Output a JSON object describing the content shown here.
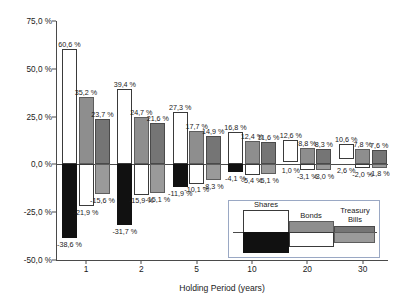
{
  "chart_data": {
    "type": "bar",
    "title": "",
    "xlabel": "Holding Period (years)",
    "ylabel": "Compound Annual Returns",
    "categories": [
      "1",
      "2",
      "5",
      "10",
      "20",
      "30"
    ],
    "ylim": [
      -50.0,
      75.0
    ],
    "yticks": [
      "75,0 %",
      "50,0 %",
      "25,0 %",
      "0,0 %",
      "-25,0 %",
      "-50,0 %"
    ],
    "ytick_values": [
      75.0,
      50.0,
      25.0,
      0.0,
      -25.0,
      -50.0
    ],
    "grid": false,
    "legend_position": "inside-bottom-right",
    "series": [
      {
        "name": "Shares",
        "max_values": [
          60.6,
          39.4,
          27.3,
          16.8,
          12.6,
          10.6
        ],
        "min_values": [
          -38.6,
          -31.7,
          -11.9,
          -4.1,
          1.0,
          2.6
        ],
        "max_labels": [
          "60,6 %",
          "39,4 %",
          "27,3 %",
          "16,8 %",
          "12,6 %",
          "10,6 %"
        ],
        "min_labels": [
          "-38,6 %",
          "-31,7 %",
          "-11,9 %",
          "-4,1 %",
          "1,0 %",
          "2,6 %"
        ]
      },
      {
        "name": "Bonds",
        "max_values": [
          35.2,
          24.7,
          17.7,
          12.4,
          8.8,
          7.8
        ],
        "min_values": [
          -21.9,
          -15.9,
          -10.1,
          -5.4,
          -3.1,
          -2.0
        ],
        "max_labels": [
          "35,2 %",
          "24,7 %",
          "17,7 %",
          "12,4 %",
          "8,8 %",
          "7,8 %"
        ],
        "min_labels": [
          "-21,9 %",
          "-15,9 %",
          "-10,1 %",
          "-5,4 %",
          "-3,1 %",
          "-2,0 %"
        ]
      },
      {
        "name": "Treasury Bills",
        "max_values": [
          23.7,
          21.6,
          14.9,
          11.6,
          8.3,
          7.6
        ],
        "min_values": [
          -15.6,
          -15.1,
          -8.3,
          -5.1,
          -3.0,
          -1.8
        ],
        "max_labels": [
          "23,7 %",
          "21,6 %",
          "14,9 %",
          "11,6 %",
          "8,3 %",
          "7,6 %"
        ],
        "min_labels": [
          "-15,6 %",
          "-15,1 %",
          "-8,3 %",
          "-5,1 %",
          "-3,0 %",
          "-1,8 %"
        ]
      }
    ]
  },
  "legend": {
    "items": [
      {
        "label_line1": "Shares",
        "label_line2": ""
      },
      {
        "label_line1": "Bonds",
        "label_line2": ""
      },
      {
        "label_line1": "Treasury",
        "label_line2": "Bills"
      }
    ]
  }
}
